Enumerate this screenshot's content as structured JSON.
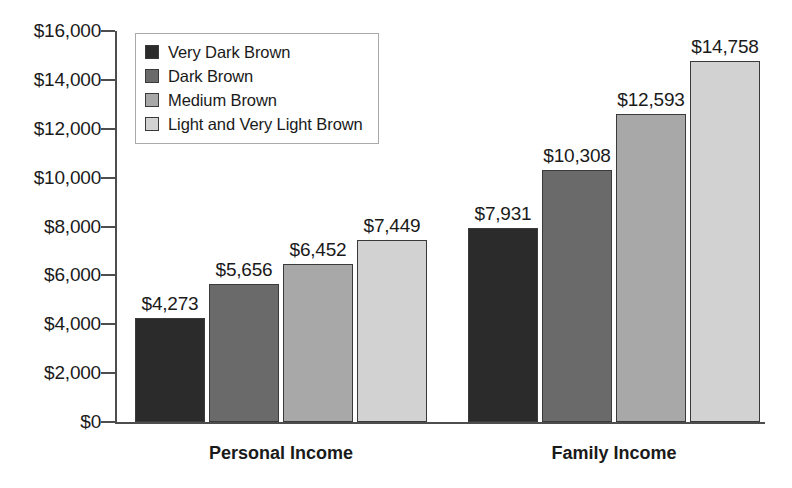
{
  "chart_data": {
    "type": "bar",
    "title": "",
    "xlabel": "",
    "ylabel": "",
    "categories": [
      "Personal Income",
      "Family Income"
    ],
    "series": [
      {
        "name": "Very Dark Brown",
        "color": "#2b2b2b",
        "values": [
          4273,
          10308
        ]
      },
      {
        "name": "Dark Brown",
        "color": "#6a6a6a",
        "values": [
          5656,
          10308
        ]
      },
      {
        "name": "Medium Brown",
        "color": "#a8a8a8",
        "values": [
          6452,
          12593
        ]
      },
      {
        "name": "Light and Very Light Brown",
        "color": "#d2d2d2",
        "values": [
          7449,
          14758
        ]
      }
    ],
    "bars": [
      {
        "group": "Personal Income",
        "series": "Very Dark Brown",
        "value": 4273,
        "label": "$4,273",
        "color": "#2b2b2b"
      },
      {
        "group": "Personal Income",
        "series": "Dark Brown",
        "value": 5656,
        "label": "$5,656",
        "color": "#6a6a6a"
      },
      {
        "group": "Personal Income",
        "series": "Medium Brown",
        "value": 6452,
        "label": "$6,452",
        "color": "#a8a8a8"
      },
      {
        "group": "Personal Income",
        "series": "Light and Very Light Brown",
        "value": 7449,
        "label": "$7,449",
        "color": "#d2d2d2"
      },
      {
        "group": "Family Income",
        "series": "Very Dark Brown",
        "value": 7931,
        "label": "$7,931",
        "color": "#2b2b2b"
      },
      {
        "group": "Family Income",
        "series": "Dark Brown",
        "value": 10308,
        "label": "$10,308",
        "color": "#6a6a6a"
      },
      {
        "group": "Family Income",
        "series": "Medium Brown",
        "value": 12593,
        "label": "$12,593",
        "color": "#a8a8a8"
      },
      {
        "group": "Family Income",
        "series": "Light and Very Light Brown",
        "value": 14758,
        "label": "$14,758",
        "color": "#d2d2d2"
      }
    ],
    "ylim": [
      0,
      16000
    ],
    "ytick_values": [
      0,
      2000,
      4000,
      6000,
      8000,
      10000,
      12000,
      14000,
      16000
    ],
    "ytick_labels": [
      "$0",
      "$2,000",
      "$4,000",
      "$6,000",
      "$8,000",
      "$10,000",
      "$12,000",
      "$14,000",
      "$16,000"
    ],
    "grid": false,
    "legend_position": "upper-left",
    "legend_entries": [
      {
        "label": "Very Dark Brown",
        "color": "#2b2b2b"
      },
      {
        "label": "Dark Brown",
        "color": "#6a6a6a"
      },
      {
        "label": "Medium Brown",
        "color": "#a8a8a8"
      },
      {
        "label": "Light and Very Light Brown",
        "color": "#d2d2d2"
      }
    ]
  },
  "axis": {
    "line_color": "#4d4d4d"
  }
}
